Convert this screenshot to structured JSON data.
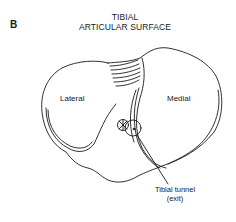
{
  "figure": {
    "panel_letter": "B",
    "title_line1": "TIBIAL",
    "title_line2": "ARTICULAR SURFACE"
  },
  "labels": {
    "lateral": "Lateral",
    "medial": "Medial"
  },
  "callout": {
    "line1": "Tibial tunnel",
    "line2": "(exit)"
  },
  "colors": {
    "line": "#1a1a1a",
    "background": "#ffffff"
  }
}
